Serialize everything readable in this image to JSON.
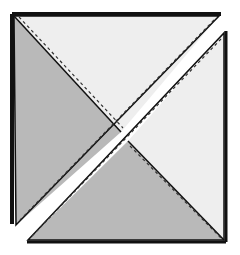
{
  "diagram": {
    "colors": {
      "background": "#ffffff",
      "light_fabric": "#eeeeee",
      "dark_fabric": "#b9b9b9",
      "outline": "#111111",
      "shadow": "#222222"
    },
    "pieces": [
      {
        "name": "upper-left-piece",
        "regions": [
          {
            "name": "light-top-triangle",
            "fill": "light_fabric",
            "points": [
              [
                14,
                16
              ],
              [
                219,
                16
              ],
              [
                121,
                132
              ]
            ]
          },
          {
            "name": "dark-left-triangle",
            "fill": "dark_fabric",
            "points": [
              [
                14,
                16
              ],
              [
                121,
                132
              ],
              [
                16,
                225
              ]
            ]
          }
        ]
      },
      {
        "name": "lower-right-piece",
        "regions": [
          {
            "name": "light-right-triangle",
            "fill": "light_fabric",
            "points": [
              [
                224,
                33
              ],
              [
                224,
                240
              ],
              [
                128,
                141
              ]
            ]
          },
          {
            "name": "dark-bottom-triangle",
            "fill": "dark_fabric",
            "points": [
              [
                128,
                141
              ],
              [
                224,
                240
              ],
              [
                28,
                240
              ]
            ]
          }
        ]
      }
    ],
    "seam_style": "dashed"
  }
}
